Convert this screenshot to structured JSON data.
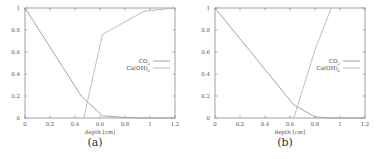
{
  "chart_data": [
    {
      "type": "line",
      "panel": "a",
      "caption": "(a)",
      "title": "",
      "xlabel": "depth [cm]",
      "ylabel": "",
      "xlim": [
        0,
        1.2
      ],
      "ylim": [
        0,
        1
      ],
      "xticks": [
        "0",
        "0.2",
        "0.4",
        "0.6",
        "0.8",
        "1",
        "1.2"
      ],
      "yticks": [
        "0",
        "0.2",
        "0.4",
        "0.6",
        "0.8",
        "1"
      ],
      "grid": false,
      "legend_position": "right-middle",
      "series": [
        {
          "name": "CO2",
          "label_main": "CO",
          "label_sub": "2",
          "color": "#9a9a9a",
          "x": [
            0,
            0.45,
            0.62,
            0.8,
            0.9,
            1.2
          ],
          "y": [
            1,
            0.2,
            0.02,
            0.005,
            0,
            0
          ]
        },
        {
          "name": "Ca(OH)2",
          "label_main": "Ca(OH)",
          "label_sub": "2",
          "color": "#b5b5b5",
          "x": [
            0.47,
            0.62,
            0.95,
            1.2
          ],
          "y": [
            0,
            0.76,
            0.97,
            1.0
          ]
        }
      ]
    },
    {
      "type": "line",
      "panel": "b",
      "caption": "(b)",
      "title": "",
      "xlabel": "depth [cm]",
      "ylabel": "",
      "xlim": [
        0,
        1.2
      ],
      "ylim": [
        0,
        1
      ],
      "xticks": [
        "0",
        "0.2",
        "0.4",
        "0.6",
        "0.8",
        "1",
        "1.2"
      ],
      "yticks": [
        "0",
        "0.2",
        "0.4",
        "0.6",
        "0.8",
        "1"
      ],
      "grid": false,
      "legend_position": "right-middle",
      "series": [
        {
          "name": "CO2",
          "label_main": "CO",
          "label_sub": "2",
          "color": "#9a9a9a",
          "x": [
            0,
            0.63,
            0.8,
            0.9,
            1.2
          ],
          "y": [
            1,
            0.12,
            0.01,
            0,
            0
          ]
        },
        {
          "name": "Ca(OH)2",
          "label_main": "Ca(OH)",
          "label_sub": "2",
          "color": "#b5b5b5",
          "x": [
            0.63,
            0.8,
            0.93
          ],
          "y": [
            0,
            0.62,
            1.0
          ]
        }
      ]
    }
  ]
}
